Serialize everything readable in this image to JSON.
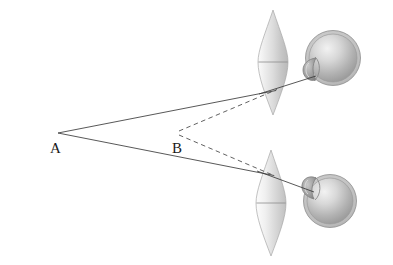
{
  "figure": {
    "type": "optics-ray-diagram",
    "width": 393,
    "height": 265,
    "background_color": "#ffffff"
  },
  "labels": {
    "point_a": "A",
    "point_b": "B"
  },
  "colors": {
    "axis_line": "#1a1a1a",
    "solid_ray": "#3a3a3a",
    "dashed_ray": "#555555",
    "lens_fill_light": "#f4f4f4",
    "lens_fill_mid": "#d2d2d2",
    "lens_fill_dark": "#b4b4b4",
    "lens_outline": "#9a9a9a",
    "eye_outline": "#8a8a8a",
    "eye_fill_light": "#e8e8e8",
    "eye_fill_mid": "#b9b9b9",
    "eye_fill_dark": "#8f8f8f",
    "cornea_fill": "#9c9c9c",
    "label_color": "#1a1a1a"
  },
  "geometry": {
    "optical_axis": {
      "x1": 12,
      "y1": 133,
      "x2": 382,
      "y2": 133
    },
    "point_a": {
      "x": 58,
      "y": 133,
      "label_x": 50,
      "label_y": 152
    },
    "point_b": {
      "x": 180,
      "y": 133,
      "label_x": 172,
      "label_y": 152
    },
    "upper_lens": {
      "cx": 273,
      "cy": 62,
      "top_y": 10,
      "bottom_y": 115,
      "half_width": 15
    },
    "lower_lens": {
      "cx": 271,
      "cy": 203,
      "top_y": 150,
      "bottom_y": 256,
      "half_width": 15
    },
    "upper_eye": {
      "cx": 333,
      "cy": 58,
      "r": 26,
      "cornea_cx": 311,
      "cornea_cy": 69,
      "cornea_r": 10
    },
    "lower_eye": {
      "cx": 329,
      "cy": 200,
      "r": 25,
      "cornea_cx": 308,
      "cornea_cy": 187,
      "cornea_r": 10
    },
    "rays": [
      {
        "name": "a-to-upper-lens",
        "style": "solid",
        "x1": 58,
        "y1": 133,
        "x2": 273,
        "y2": 91
      },
      {
        "name": "b-to-upper-lens",
        "style": "dashed",
        "x1": 181,
        "y1": 133,
        "x2": 273,
        "y2": 91
      },
      {
        "name": "upper-lens-to-eye",
        "style": "solid",
        "x1": 262,
        "y1": 93,
        "x2": 312,
        "y2": 77
      },
      {
        "name": "a-to-lower-lens",
        "style": "solid",
        "x1": 58,
        "y1": 133,
        "x2": 271,
        "y2": 175
      },
      {
        "name": "b-to-lower-lens",
        "style": "dashed",
        "x1": 181,
        "y1": 133,
        "x2": 271,
        "y2": 175
      },
      {
        "name": "lower-lens-to-eye",
        "style": "solid",
        "x1": 260,
        "y1": 172,
        "x2": 310,
        "y2": 191
      }
    ]
  }
}
